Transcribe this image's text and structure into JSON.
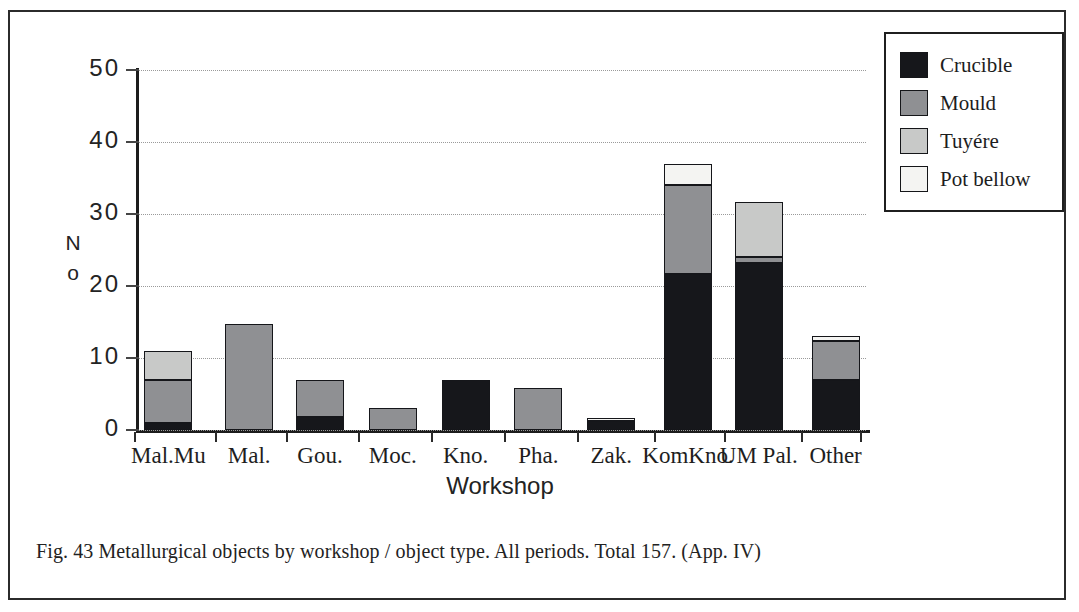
{
  "figure": {
    "caption": "Fig. 43  Metallurgical  objects  by  workshop / object  type. All  periods. Total 157. (App. IV)"
  },
  "legend": {
    "items": [
      {
        "label": "Crucible",
        "color": "#16171b",
        "key": "crucible"
      },
      {
        "label": "Mould",
        "color": "#8f9093",
        "key": "mould"
      },
      {
        "label": "Tuyére",
        "color": "#c8c9c8",
        "key": "tuyere"
      },
      {
        "label": "Pot bellow",
        "color": "#f4f4f2",
        "key": "potbellow"
      }
    ]
  },
  "axes": {
    "y_title_line1": "N",
    "y_title_line2": "o",
    "x_title": "Workshop",
    "y_ticks": [
      "0",
      "10",
      "20",
      "30",
      "40",
      "50"
    ]
  },
  "chart_data": {
    "type": "bar",
    "stacked": true,
    "title": "Fig. 43  Metallurgical  objects  by  workshop / object  type. All  periods. Total 157. (App. IV)",
    "xlabel": "Workshop",
    "ylabel": "No",
    "ylim": [
      0,
      50
    ],
    "ytick_values": [
      0,
      10,
      20,
      30,
      40,
      50
    ],
    "grid": "horizontal-dotted",
    "legend_position": "top-right-outside",
    "total": 157,
    "categories": [
      "Mal.Mu",
      "Mal.",
      "Gou.",
      "Moc.",
      "Kno.",
      "Pha.",
      "Zak.",
      "KomKno.",
      "UM Pal.",
      "Other"
    ],
    "series": [
      {
        "name": "Crucible",
        "color": "#16171b",
        "values": [
          1.0,
          0.0,
          1.8,
          0.0,
          6.9,
          0.0,
          1.3,
          21.6,
          23.2,
          7.0
        ]
      },
      {
        "name": "Mould",
        "color": "#8f9093",
        "values": [
          6.0,
          14.7,
          5.1,
          3.0,
          0.0,
          5.8,
          0.0,
          12.4,
          0.8,
          5.3
        ]
      },
      {
        "name": "Tuyére",
        "color": "#c8c9c8",
        "values": [
          4.0,
          0.0,
          0.0,
          0.0,
          0.0,
          0.0,
          0.0,
          0.0,
          7.7,
          0.0
        ]
      },
      {
        "name": "Pot bellow",
        "color": "#f4f4f2",
        "values": [
          0.0,
          0.0,
          0.0,
          0.0,
          0.0,
          0.0,
          0.4,
          3.0,
          0.0,
          0.7
        ]
      }
    ],
    "totals": [
      11.0,
      14.7,
      6.9,
      3.0,
      6.9,
      5.8,
      1.7,
      37.0,
      31.7,
      13.0
    ]
  }
}
